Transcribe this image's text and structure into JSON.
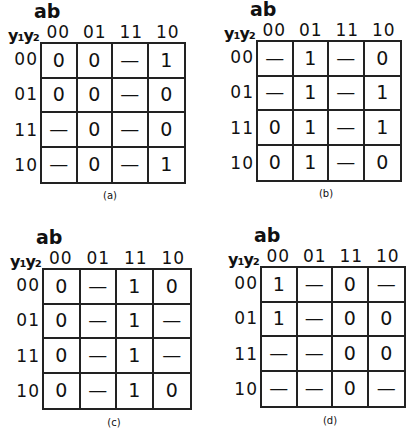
{
  "col_var_label": "ab",
  "row_var_label": "y₁y₂",
  "col_headers": [
    "00",
    "01",
    "11",
    "10"
  ],
  "row_headers": [
    "00",
    "01",
    "11",
    "10"
  ],
  "maps": [
    {
      "caption": "(a)",
      "cells": [
        [
          "0",
          "0",
          "—",
          "1"
        ],
        [
          "0",
          "0",
          "—",
          "0"
        ],
        [
          "—",
          "0",
          "—",
          "0"
        ],
        [
          "—",
          "0",
          "—",
          "1"
        ]
      ]
    },
    {
      "caption": "(b)",
      "cells": [
        [
          "—",
          "1",
          "—",
          "0"
        ],
        [
          "—",
          "1",
          "—",
          "1"
        ],
        [
          "0",
          "1",
          "—",
          "1"
        ],
        [
          "0",
          "1",
          "—",
          "0"
        ]
      ]
    },
    {
      "caption": "(c)",
      "cells": [
        [
          "0",
          "—",
          "1",
          "0"
        ],
        [
          "0",
          "—",
          "1",
          "—"
        ],
        [
          "0",
          "—",
          "1",
          "—"
        ],
        [
          "0",
          "—",
          "1",
          "0"
        ]
      ]
    },
    {
      "caption": "(d)",
      "cells": [
        [
          "1",
          "—",
          "0",
          "—"
        ],
        [
          "1",
          "—",
          "0",
          "0"
        ],
        [
          "—",
          "—",
          "0",
          "0"
        ],
        [
          "—",
          "—",
          "0",
          "—"
        ]
      ]
    }
  ]
}
